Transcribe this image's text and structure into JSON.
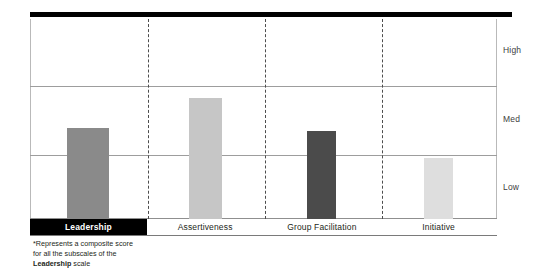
{
  "chart_data": {
    "type": "bar",
    "title": "",
    "xlabel": "",
    "ylabel": "",
    "categories": [
      "Leadership",
      "Assertiveness",
      "Group Facilitation",
      "Initiative"
    ],
    "values": [
      1.37,
      1.81,
      1.32,
      0.91
    ],
    "ytick_labels": [
      "Low",
      "Med",
      "High"
    ],
    "ylim": [
      0,
      3
    ],
    "yticks": [
      0,
      1,
      2,
      3
    ],
    "grid": "horizontal-gridlines-at-band-boundaries",
    "legend": "none",
    "bar_colors": [
      "#8a8a8a",
      "#c6c6c6",
      "#4b4b4b",
      "#dedede"
    ],
    "bar_bands": [
      "Med",
      "Med",
      "Med",
      "Low"
    ],
    "series": [
      {
        "name": "Score",
        "points": [
          {
            "category": "Leadership",
            "value": 1.37,
            "band": "Med",
            "color": "#8a8a8a",
            "highlighted": true
          },
          {
            "category": "Assertiveness",
            "value": 1.81,
            "band": "Med",
            "color": "#c6c6c6",
            "highlighted": false
          },
          {
            "category": "Group Facilitation",
            "value": 1.32,
            "band": "Med",
            "color": "#4b4b4b",
            "highlighted": false
          },
          {
            "category": "Initiative",
            "value": 0.91,
            "band": "Low",
            "color": "#dedede",
            "highlighted": false
          }
        ]
      }
    ],
    "annotations": [
      "*Represents a composite score",
      "for all the subscales of the",
      "Leadership scale"
    ]
  },
  "axis": {
    "high_label": "High",
    "med_label": "Med",
    "low_label": "Low"
  },
  "categories": [
    {
      "label": "Leadership",
      "highlighted": true
    },
    {
      "label": "Assertiveness",
      "highlighted": false
    },
    {
      "label": "Group Facilitation",
      "highlighted": false
    },
    {
      "label": "Initiative",
      "highlighted": false
    }
  ],
  "footnote": {
    "line1": "*Represents a composite score",
    "line2": "for all the subscales of the",
    "line3_strong": "Leadership",
    "line3_rest": " scale"
  }
}
